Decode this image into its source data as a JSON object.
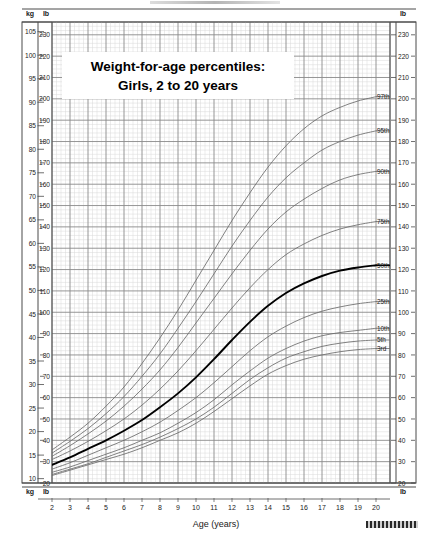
{
  "chart_data": {
    "type": "line",
    "title": "Weight-for-age percentiles:",
    "subtitle": "Girls, 2 to 20 years",
    "xlabel": "Age (years)",
    "ylabel_left_top": "kg",
    "ylabel_left_unit2": "lb",
    "ylabel_right_unit": "lb",
    "xlim": [
      2,
      20
    ],
    "xticks": [
      2,
      3,
      4,
      5,
      6,
      7,
      8,
      9,
      10,
      11,
      12,
      13,
      14,
      15,
      16,
      17,
      18,
      19,
      20
    ],
    "kg_ticks": [
      10,
      15,
      20,
      25,
      30,
      35,
      40,
      45,
      50,
      55,
      60,
      65,
      70,
      75,
      80,
      85,
      90,
      95,
      100,
      105
    ],
    "lb_ticks": [
      20,
      30,
      40,
      50,
      60,
      70,
      80,
      90,
      100,
      110,
      120,
      130,
      140,
      150,
      160,
      170,
      180,
      190,
      200,
      210,
      220,
      230
    ],
    "lb_lim": [
      20,
      236
    ],
    "grid": true,
    "legend_position": "right-curve-labels",
    "x": [
      2,
      3,
      4,
      5,
      6,
      7,
      8,
      9,
      10,
      11,
      12,
      13,
      14,
      15,
      16,
      17,
      18,
      19,
      20
    ],
    "series": [
      {
        "name": "97th",
        "label": "97th",
        "emphasis": false,
        "values_lb": [
          35.5,
          41.5,
          48.0,
          56.0,
          65.0,
          76.0,
          88.0,
          101.0,
          115.0,
          129.0,
          143.0,
          156.0,
          168.0,
          178.0,
          186.0,
          192.0,
          196.0,
          199.0,
          201.0
        ]
      },
      {
        "name": "95th",
        "label": "95th",
        "emphasis": false,
        "values_lb": [
          34.0,
          39.5,
          45.5,
          52.5,
          60.5,
          70.0,
          80.5,
          92.5,
          105.0,
          118.0,
          131.0,
          143.0,
          154.0,
          163.0,
          170.0,
          176.0,
          180.0,
          183.0,
          185.0
        ]
      },
      {
        "name": "90th",
        "label": "90th",
        "emphasis": false,
        "values_lb": [
          32.5,
          37.5,
          43.0,
          49.0,
          56.0,
          64.0,
          73.0,
          83.5,
          95.0,
          106.5,
          118.0,
          129.0,
          139.0,
          147.0,
          153.0,
          158.0,
          162.0,
          164.5,
          166.0
        ]
      },
      {
        "name": "75th",
        "label": "75th",
        "emphasis": false,
        "values_lb": [
          31.0,
          35.0,
          39.5,
          44.5,
          50.0,
          56.5,
          64.0,
          72.5,
          82.0,
          92.0,
          102.0,
          111.5,
          120.0,
          127.0,
          132.0,
          136.0,
          139.0,
          141.0,
          142.5
        ]
      },
      {
        "name": "50th",
        "label": "50th",
        "emphasis": true,
        "values_lb": [
          28.5,
          32.0,
          36.0,
          40.0,
          44.5,
          49.5,
          55.5,
          62.0,
          69.5,
          78.0,
          87.0,
          95.5,
          103.0,
          109.0,
          113.5,
          117.0,
          119.5,
          121.0,
          122.0
        ]
      },
      {
        "name": "25th",
        "label": "25th",
        "emphasis": false,
        "values_lb": [
          26.5,
          29.5,
          33.0,
          36.5,
          40.0,
          44.0,
          48.5,
          54.0,
          60.0,
          67.0,
          74.5,
          82.0,
          88.5,
          93.5,
          97.5,
          100.5,
          102.5,
          104.0,
          105.0
        ]
      },
      {
        "name": "10th",
        "label": "10th",
        "emphasis": false,
        "values_lb": [
          25.0,
          27.5,
          30.5,
          33.5,
          36.5,
          40.0,
          43.5,
          48.0,
          53.0,
          59.0,
          66.0,
          72.5,
          78.5,
          83.0,
          86.5,
          89.0,
          90.5,
          91.5,
          92.5
        ]
      },
      {
        "name": "5th",
        "label": "5th",
        "emphasis": false,
        "values_lb": [
          24.0,
          26.5,
          29.0,
          32.0,
          35.0,
          38.0,
          41.5,
          45.5,
          50.0,
          55.5,
          62.0,
          68.5,
          74.0,
          78.5,
          81.5,
          84.0,
          85.5,
          86.5,
          87.0
        ]
      },
      {
        "name": "3rd",
        "label": "3rd",
        "emphasis": false,
        "values_lb": [
          23.5,
          26.0,
          28.5,
          31.0,
          33.5,
          36.5,
          40.0,
          43.5,
          48.0,
          53.5,
          59.5,
          65.5,
          71.0,
          75.0,
          78.0,
          80.0,
          81.5,
          82.5,
          83.0
        ]
      }
    ],
    "colors": {
      "curve": "#6b6b6b",
      "curve_emphasis": "#000000",
      "grid_major": "#8a8a8a",
      "grid_minor": "#d8d8d8",
      "frame": "#4a4a4a",
      "text": "#1a1a1a"
    }
  },
  "axes": {
    "corner_top_left_kg": "kg",
    "corner_top_left_lb": "lb",
    "corner_top_right_lb": "lb",
    "corner_bottom_left_kg": "kg",
    "corner_bottom_left_lb": "lb",
    "corner_bottom_right_lb": "lb"
  }
}
